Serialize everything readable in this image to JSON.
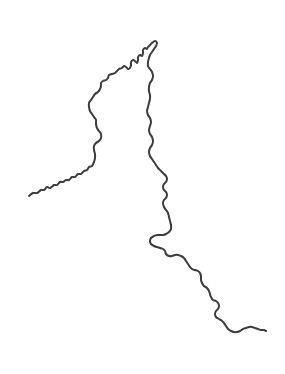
{
  "figure": {
    "kind": "line-drawing",
    "width": 285,
    "height": 374,
    "background_color": "#ffffff"
  },
  "style": {
    "stroke_color": "#3c3c3c",
    "stroke_width": 2,
    "fill": "none",
    "linecap": "round",
    "linejoin": "round"
  },
  "features": [
    {
      "name": "boundary-line",
      "type": "polyline",
      "closed": false,
      "endpoints": {
        "west_terminus": [
          29,
          196
        ],
        "apex": [
          155,
          41
        ],
        "southeast_terminus": [
          266,
          331
        ]
      },
      "points": [
        [
          29,
          196
        ],
        [
          33,
          193
        ],
        [
          37,
          193
        ],
        [
          41,
          190
        ],
        [
          44,
          190
        ],
        [
          47,
          187
        ],
        [
          50,
          188
        ],
        [
          54,
          185
        ],
        [
          57,
          185
        ],
        [
          60,
          182
        ],
        [
          63,
          182
        ],
        [
          66,
          180
        ],
        [
          69,
          180
        ],
        [
          72,
          177
        ],
        [
          75,
          177
        ],
        [
          78,
          174
        ],
        [
          81,
          174
        ],
        [
          84,
          171
        ],
        [
          87,
          170
        ],
        [
          89,
          167
        ],
        [
          92,
          166
        ],
        [
          94,
          162
        ],
        [
          95,
          158
        ],
        [
          95,
          154
        ],
        [
          94,
          150
        ],
        [
          94,
          146
        ],
        [
          96,
          143
        ],
        [
          99,
          141
        ],
        [
          101,
          138
        ],
        [
          101,
          134
        ],
        [
          99,
          131
        ],
        [
          97,
          128
        ],
        [
          96,
          124
        ],
        [
          96,
          120
        ],
        [
          94,
          117
        ],
        [
          92,
          114
        ],
        [
          90,
          111
        ],
        [
          89,
          107
        ],
        [
          89,
          103
        ],
        [
          91,
          100
        ],
        [
          93,
          97
        ],
        [
          95,
          94
        ],
        [
          98,
          92
        ],
        [
          100,
          89
        ],
        [
          101,
          86
        ],
        [
          101,
          83
        ],
        [
          103,
          81
        ],
        [
          106,
          80
        ],
        [
          108,
          78
        ],
        [
          109,
          75
        ],
        [
          112,
          74
        ],
        [
          115,
          73
        ],
        [
          117,
          71
        ],
        [
          119,
          69
        ],
        [
          122,
          68
        ],
        [
          124,
          66
        ],
        [
          126,
          67
        ],
        [
          128,
          69
        ],
        [
          130,
          68
        ],
        [
          131,
          65
        ],
        [
          131,
          62
        ],
        [
          133,
          60
        ],
        [
          135,
          61
        ],
        [
          137,
          63
        ],
        [
          138,
          60
        ],
        [
          138,
          57
        ],
        [
          140,
          55
        ],
        [
          142,
          56
        ],
        [
          143,
          53
        ],
        [
          143,
          50
        ],
        [
          145,
          48
        ],
        [
          147,
          49
        ],
        [
          148,
          47
        ],
        [
          150,
          45
        ],
        [
          152,
          43
        ],
        [
          155,
          41
        ],
        [
          157,
          43
        ],
        [
          156,
          46
        ],
        [
          154,
          49
        ],
        [
          152,
          52
        ],
        [
          150,
          55
        ],
        [
          149,
          58
        ],
        [
          148,
          62
        ],
        [
          148,
          66
        ],
        [
          150,
          69
        ],
        [
          152,
          72
        ],
        [
          153,
          76
        ],
        [
          152,
          80
        ],
        [
          150,
          83
        ],
        [
          149,
          87
        ],
        [
          149,
          91
        ],
        [
          150,
          95
        ],
        [
          150,
          99
        ],
        [
          149,
          103
        ],
        [
          148,
          107
        ],
        [
          147,
          111
        ],
        [
          148,
          115
        ],
        [
          150,
          118
        ],
        [
          151,
          122
        ],
        [
          150,
          126
        ],
        [
          149,
          130
        ],
        [
          150,
          134
        ],
        [
          152,
          137
        ],
        [
          153,
          141
        ],
        [
          152,
          145
        ],
        [
          150,
          148
        ],
        [
          149,
          152
        ],
        [
          150,
          156
        ],
        [
          152,
          159
        ],
        [
          154,
          162
        ],
        [
          156,
          165
        ],
        [
          158,
          168
        ],
        [
          160,
          170
        ],
        [
          162,
          172
        ],
        [
          164,
          174
        ],
        [
          166,
          176
        ],
        [
          167,
          179
        ],
        [
          166,
          182
        ],
        [
          164,
          184
        ],
        [
          163,
          187
        ],
        [
          164,
          190
        ],
        [
          166,
          192
        ],
        [
          167,
          195
        ],
        [
          166,
          198
        ],
        [
          164,
          200
        ],
        [
          163,
          203
        ],
        [
          164,
          207
        ],
        [
          166,
          210
        ],
        [
          168,
          213
        ],
        [
          169,
          217
        ],
        [
          170,
          221
        ],
        [
          171,
          225
        ],
        [
          171,
          229
        ],
        [
          169,
          232
        ],
        [
          166,
          234
        ],
        [
          163,
          235
        ],
        [
          160,
          235
        ],
        [
          157,
          235
        ],
        [
          154,
          236
        ],
        [
          151,
          238
        ],
        [
          150,
          241
        ],
        [
          151,
          244
        ],
        [
          154,
          246
        ],
        [
          157,
          247
        ],
        [
          160,
          248
        ],
        [
          163,
          249
        ],
        [
          165,
          251
        ],
        [
          166,
          254
        ],
        [
          169,
          256
        ],
        [
          172,
          256
        ],
        [
          175,
          255
        ],
        [
          178,
          255
        ],
        [
          181,
          256
        ],
        [
          184,
          258
        ],
        [
          186,
          261
        ],
        [
          188,
          264
        ],
        [
          190,
          267
        ],
        [
          192,
          269
        ],
        [
          195,
          270
        ],
        [
          198,
          271
        ],
        [
          200,
          273
        ],
        [
          201,
          276
        ],
        [
          201,
          280
        ],
        [
          202,
          283
        ],
        [
          204,
          286
        ],
        [
          207,
          288
        ],
        [
          209,
          291
        ],
        [
          210,
          294
        ],
        [
          211,
          297
        ],
        [
          213,
          300
        ],
        [
          216,
          301
        ],
        [
          218,
          303
        ],
        [
          219,
          306
        ],
        [
          218,
          309
        ],
        [
          216,
          311
        ],
        [
          215,
          314
        ],
        [
          216,
          317
        ],
        [
          219,
          319
        ],
        [
          222,
          321
        ],
        [
          224,
          323
        ],
        [
          226,
          326
        ],
        [
          228,
          329
        ],
        [
          231,
          331
        ],
        [
          234,
          332
        ],
        [
          237,
          332
        ],
        [
          240,
          331
        ],
        [
          243,
          329
        ],
        [
          246,
          328
        ],
        [
          249,
          327
        ],
        [
          252,
          327
        ],
        [
          255,
          328
        ],
        [
          258,
          329
        ],
        [
          261,
          330
        ],
        [
          264,
          330
        ],
        [
          266,
          331
        ]
      ]
    }
  ],
  "labels": [],
  "legend": null,
  "annotations": []
}
